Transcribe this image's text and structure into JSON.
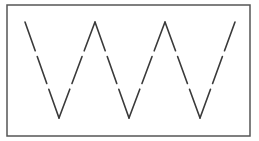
{
  "diagram": {
    "type": "dashed-zigzag",
    "frame": {
      "x": 7,
      "y": 5,
      "width": 243,
      "height": 131,
      "stroke": "#555555",
      "stroke_width": 1.5
    },
    "line": {
      "stroke": "#3a3a3a",
      "stroke_width": 1.6,
      "dash": "32 9",
      "points": [
        [
          25,
          22
        ],
        [
          59,
          118
        ],
        [
          95,
          22
        ],
        [
          129,
          118
        ],
        [
          165,
          22
        ],
        [
          200,
          118
        ],
        [
          235,
          22
        ]
      ]
    },
    "background": "#ffffff"
  }
}
